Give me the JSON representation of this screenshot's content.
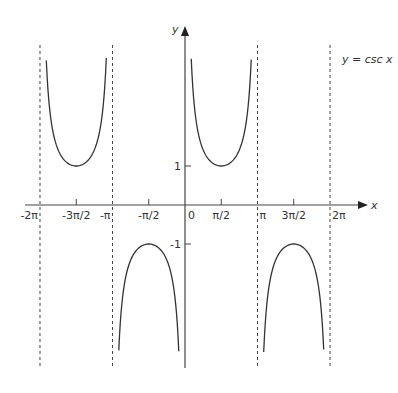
{
  "chart_data": {
    "type": "line",
    "title": "",
    "function_label": "y = csc x",
    "xlabel": "x",
    "ylabel": "y",
    "x_ticks": [
      {
        "value": -6.2832,
        "label": "-2π"
      },
      {
        "value": -4.7124,
        "label": "-3π/2"
      },
      {
        "value": -3.1416,
        "label": "-π"
      },
      {
        "value": -1.5708,
        "label": "-π/2"
      },
      {
        "value": 0,
        "label": "0"
      },
      {
        "value": 1.5708,
        "label": "π/2"
      },
      {
        "value": 3.1416,
        "label": "π"
      },
      {
        "value": 4.7124,
        "label": "3π/2"
      },
      {
        "value": 6.2832,
        "label": "2π"
      }
    ],
    "y_ticks": [
      {
        "value": 1,
        "label": "1"
      },
      {
        "value": -1,
        "label": "-1"
      }
    ],
    "asymptotes_x": [
      -6.2832,
      -3.1416,
      3.1416,
      6.2832
    ],
    "xlim": [
      -6.6,
      7.0
    ],
    "ylim": [
      -4.2,
      4.2
    ],
    "grid": false,
    "series": [
      {
        "name": "csc x on (-2π, -π)",
        "x_range": [
          -6.01,
          -3.41
        ],
        "min_point": [
          -4.7124,
          1
        ]
      },
      {
        "name": "csc x on (-π, 0)",
        "x_range": [
          -2.87,
          -0.27
        ],
        "max_point": [
          -1.5708,
          -1
        ]
      },
      {
        "name": "csc x on (0, π)",
        "x_range": [
          0.27,
          2.87
        ],
        "min_point": [
          1.5708,
          1
        ]
      },
      {
        "name": "csc x on (π, 2π)",
        "x_range": [
          3.41,
          6.01
        ],
        "max_point": [
          4.7124,
          -1
        ]
      }
    ]
  }
}
